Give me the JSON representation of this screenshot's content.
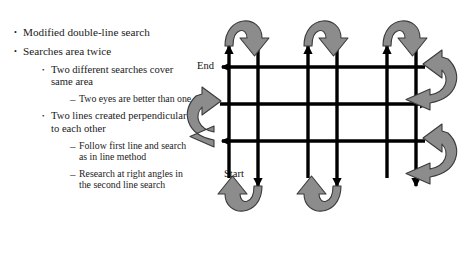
{
  "slide": {
    "title_text_block": {
      "bullets": [
        {
          "level": 1,
          "marker": "•",
          "text": "Modified double-line search"
        },
        {
          "level": 1,
          "marker": "•",
          "text": "Searches area twice"
        },
        {
          "level": 2,
          "marker": "•",
          "text": "Two different searches cover same area"
        },
        {
          "level": 3,
          "marker": "–",
          "text": "Two eyes are better than one"
        },
        {
          "level": 2,
          "marker": "•",
          "text": "Two lines created perpendicular to each other"
        },
        {
          "level": 3,
          "marker": "–",
          "text": "Follow first line and search as in line method"
        },
        {
          "level": 3,
          "marker": "–",
          "text": "Research at right angles in the second line search"
        }
      ]
    }
  },
  "diagram": {
    "name": "double-line-search-grid",
    "labels": {
      "end": "End",
      "start": "Start"
    },
    "colors": {
      "grid_line": "#000000",
      "turn_arrow_fill": "#8c8c8c",
      "turn_arrow_stroke": "#3a3a3a",
      "background": "#ffffff"
    },
    "structure": {
      "vertical_lines": 6,
      "horizontal_lines": 3,
      "vertical_directions": [
        "up",
        "down",
        "up",
        "down",
        "up",
        "down"
      ],
      "horizontal_directions": [
        "left",
        "right",
        "left"
      ],
      "top_u_turn_arrows": 3,
      "bottom_u_turn_arrows": 2,
      "left_loop_arrows": 1,
      "right_loop_arrows": 2
    }
  }
}
